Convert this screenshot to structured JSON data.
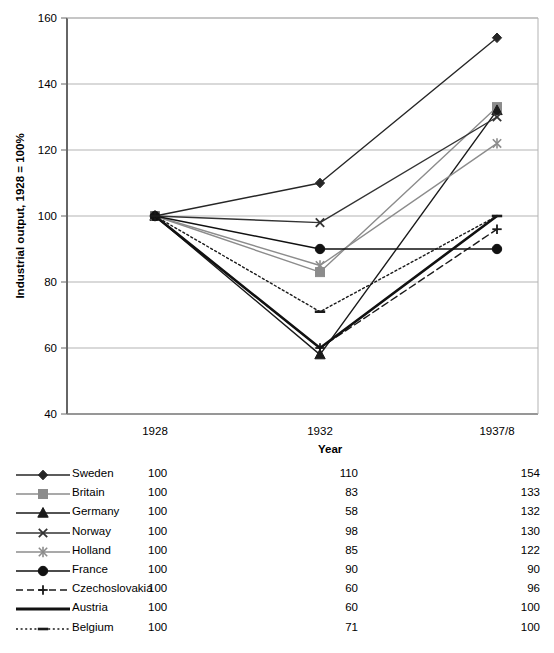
{
  "chart_data": {
    "type": "line",
    "title": "",
    "xlabel": "Year",
    "ylabel": "Industrial output, 1928 = 100%",
    "x": [
      "1928",
      "1932",
      "1937/8"
    ],
    "categories": [
      "1928",
      "1932",
      "1937/8"
    ],
    "ylim": [
      40,
      160
    ],
    "yticks": [
      40,
      60,
      80,
      100,
      120,
      140,
      160
    ],
    "grid": true,
    "legend_position": "bottom-table",
    "series": [
      {
        "name": "Sweden",
        "values": [
          100,
          110,
          154
        ],
        "marker": "diamond",
        "line": "solid",
        "color": "#262626"
      },
      {
        "name": "Britain",
        "values": [
          100,
          83,
          133
        ],
        "marker": "square",
        "line": "solid",
        "color": "#8c8c8c"
      },
      {
        "name": "Germany",
        "values": [
          100,
          58,
          132
        ],
        "marker": "triangle",
        "line": "solid",
        "color": "#1a1a1a"
      },
      {
        "name": "Norway",
        "values": [
          100,
          98,
          130
        ],
        "marker": "x",
        "line": "solid",
        "color": "#333333"
      },
      {
        "name": "Holland",
        "values": [
          100,
          85,
          122
        ],
        "marker": "asterisk",
        "line": "solid",
        "color": "#8c8c8c"
      },
      {
        "name": "France",
        "values": [
          100,
          90,
          90
        ],
        "marker": "circle",
        "line": "solid",
        "color": "#111111"
      },
      {
        "name": "Czechoslovakia",
        "values": [
          100,
          60,
          96
        ],
        "marker": "plus",
        "line": "dashed",
        "color": "#1a1a1a"
      },
      {
        "name": "Austria",
        "values": [
          100,
          60,
          100
        ],
        "marker": "none",
        "line": "thick",
        "color": "#111111"
      },
      {
        "name": "Belgium",
        "values": [
          100,
          71,
          100
        ],
        "marker": "dash",
        "line": "dotted",
        "color": "#1a1a1a"
      }
    ]
  },
  "axis": {
    "y_title": "Industrial output, 1928 = 100%",
    "x_title": "Year",
    "y_ticks": [
      "160",
      "140",
      "120",
      "100",
      "80",
      "60",
      "40"
    ],
    "x_ticks": [
      "1928",
      "1932",
      "1937/8"
    ]
  },
  "legend_table": {
    "year_header": "Year",
    "rows": [
      {
        "label": "Sweden",
        "v1928": "100",
        "v1932": "110",
        "v1937": "154"
      },
      {
        "label": "Britain",
        "v1928": "100",
        "v1932": "83",
        "v1937": "133"
      },
      {
        "label": "Germany",
        "v1928": "100",
        "v1932": "58",
        "v1937": "132"
      },
      {
        "label": "Norway",
        "v1928": "100",
        "v1932": "98",
        "v1937": "130"
      },
      {
        "label": "Holland",
        "v1928": "100",
        "v1932": "85",
        "v1937": "122"
      },
      {
        "label": "France",
        "v1928": "100",
        "v1932": "90",
        "v1937": "90"
      },
      {
        "label": "Czechoslovakia",
        "v1928": "100",
        "v1932": "60",
        "v1937": "96"
      },
      {
        "label": "Austria",
        "v1928": "100",
        "v1932": "60",
        "v1937": "100"
      },
      {
        "label": "Belgium",
        "v1928": "100",
        "v1932": "71",
        "v1937": "100"
      }
    ]
  },
  "colors": {
    "grid": "#b3b3b3",
    "frame": "#808080",
    "dark": "#1a1a1a",
    "grey_series": "#8c8c8c"
  }
}
